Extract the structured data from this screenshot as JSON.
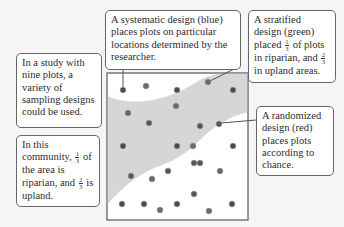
{
  "callouts": {
    "study": {
      "text": "In a study with nine plots, a variety of sampling designs could be used."
    },
    "community": {
      "t1": "In this community, ",
      "f1n": "1",
      "f1d": "3",
      "t2": " of the area is riparian, and ",
      "f2n": "2",
      "f2d": "3",
      "t3": " is upland."
    },
    "systematic": {
      "text": "A systematic design (blue) places plots on particular locations determined by the researcher."
    },
    "stratified": {
      "t1": "A stratified design (green) placed ",
      "f1n": "1",
      "f1d": "3",
      "t2": " of plots in riparian, and ",
      "f2n": "2",
      "f2d": "3",
      "t3": " in upland areas."
    },
    "randomized": {
      "text": "A randomized design (red) places plots according to chance."
    }
  },
  "colors": {
    "background": "#f5f5f5",
    "plot_background": "#ffffff",
    "riparian_band": "#d6d6d6",
    "systematic_blue": "#4a4a4a",
    "stratified_green": "#6a6a6a",
    "randomized_red": "#555555"
  },
  "plot_frame": {
    "x": 107,
    "y": 73,
    "width": 141,
    "height": 147
  },
  "dots": [
    {
      "x": 123,
      "y": 90,
      "design": "systematic"
    },
    {
      "x": 146,
      "y": 86,
      "design": "stratified"
    },
    {
      "x": 177,
      "y": 90,
      "design": "systematic"
    },
    {
      "x": 208,
      "y": 82,
      "design": "stratified"
    },
    {
      "x": 233,
      "y": 90,
      "design": "systematic"
    },
    {
      "x": 128,
      "y": 113,
      "design": "stratified"
    },
    {
      "x": 176,
      "y": 106,
      "design": "stratified"
    },
    {
      "x": 149,
      "y": 123,
      "design": "randomized"
    },
    {
      "x": 200,
      "y": 126,
      "design": "randomized"
    },
    {
      "x": 219,
      "y": 124,
      "design": "randomized"
    },
    {
      "x": 123,
      "y": 146,
      "design": "systematic"
    },
    {
      "x": 177,
      "y": 146,
      "design": "systematic"
    },
    {
      "x": 193,
      "y": 146,
      "design": "stratified"
    },
    {
      "x": 233,
      "y": 146,
      "design": "systematic"
    },
    {
      "x": 194,
      "y": 163,
      "design": "randomized"
    },
    {
      "x": 200,
      "y": 163,
      "design": "randomized"
    },
    {
      "x": 131,
      "y": 176,
      "design": "randomized"
    },
    {
      "x": 152,
      "y": 179,
      "design": "stratified"
    },
    {
      "x": 168,
      "y": 171,
      "design": "randomized"
    },
    {
      "x": 220,
      "y": 171,
      "design": "stratified"
    },
    {
      "x": 194,
      "y": 194,
      "design": "randomized"
    },
    {
      "x": 122,
      "y": 204,
      "design": "systematic"
    },
    {
      "x": 144,
      "y": 204,
      "design": "systematic"
    },
    {
      "x": 177,
      "y": 204,
      "design": "systematic"
    },
    {
      "x": 232,
      "y": 204,
      "design": "systematic"
    },
    {
      "x": 160,
      "y": 210,
      "design": "stratified"
    },
    {
      "x": 209,
      "y": 211,
      "design": "stratified"
    }
  ]
}
